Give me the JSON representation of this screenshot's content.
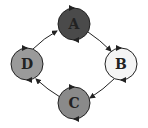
{
  "diagram": {
    "type": "cycle",
    "nodes": [
      {
        "id": "A",
        "label": "A",
        "cx": 74,
        "cy": 24,
        "r": 16,
        "fill": "#4a4a4a"
      },
      {
        "id": "B",
        "label": "B",
        "cx": 121,
        "cy": 64,
        "r": 16,
        "fill": "#f4f4f4"
      },
      {
        "id": "C",
        "label": "C",
        "cx": 74,
        "cy": 103,
        "r": 16,
        "fill": "#8a8a8a"
      },
      {
        "id": "D",
        "label": "D",
        "cx": 27,
        "cy": 64,
        "r": 16,
        "fill": "#9a9a9a"
      }
    ],
    "edges": [
      {
        "from": "A",
        "to": "B"
      },
      {
        "from": "B",
        "to": "C"
      },
      {
        "from": "C",
        "to": "D"
      },
      {
        "from": "D",
        "to": "A"
      }
    ],
    "stroke_color": "#222222"
  }
}
